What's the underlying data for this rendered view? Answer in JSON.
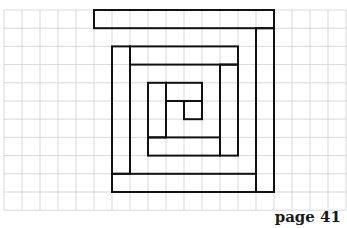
{
  "page": {
    "label": "page 41"
  },
  "grid": {
    "origin_x": 4,
    "origin_y": 10,
    "cell_w": 18,
    "cell_h": 18.2,
    "cols": 19,
    "rows": 11,
    "line_color": "#cfcfcf",
    "shape_color": "#111111"
  },
  "spiral": {
    "description": "square spiral drawn as rectangles on grid paper",
    "rects": [
      {
        "id": "top-bar",
        "c1": 5,
        "r1": 0,
        "c2": 15,
        "r2": 1
      },
      {
        "id": "right-bar",
        "c1": 14,
        "r1": 1,
        "c2": 15,
        "r2": 10
      },
      {
        "id": "bottom-bar",
        "c1": 6,
        "r1": 9,
        "c2": 14,
        "r2": 10
      },
      {
        "id": "left-bar",
        "c1": 6,
        "r1": 2,
        "c2": 7,
        "r2": 9
      },
      {
        "id": "inner-top-bar",
        "c1": 7,
        "r1": 2,
        "c2": 13,
        "r2": 3
      },
      {
        "id": "inner-right-bar",
        "c1": 12,
        "r1": 3,
        "c2": 13,
        "r2": 8
      },
      {
        "id": "inner-bottom-bar",
        "c1": 8,
        "r1": 7,
        "c2": 12,
        "r2": 8
      },
      {
        "id": "inner-left-bar",
        "c1": 8,
        "r1": 4,
        "c2": 9,
        "r2": 7
      },
      {
        "id": "core-top-bar",
        "c1": 9,
        "r1": 4,
        "c2": 11,
        "r2": 5
      },
      {
        "id": "core-square",
        "c1": 10,
        "r1": 5,
        "c2": 11,
        "r2": 6
      }
    ]
  }
}
